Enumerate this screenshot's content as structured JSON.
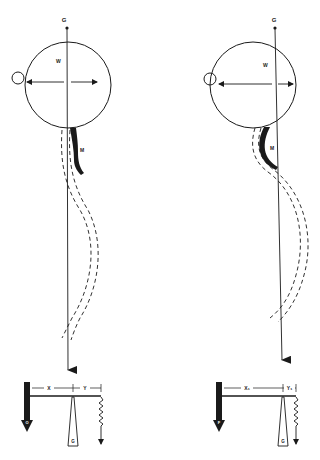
{
  "figure": {
    "ink_color": "#1a1a1a",
    "background": "#ffffff",
    "panels": [
      {
        "id": "left",
        "labels": {
          "gravity_top": "G",
          "sphere": "W",
          "member": "M",
          "distance_left": "X",
          "distance_right": "Y",
          "weight": "G",
          "force_block": "O"
        }
      },
      {
        "id": "right",
        "labels": {
          "gravity_top": "G",
          "sphere": "W",
          "member": "M",
          "distance_left": "X₁",
          "distance_right": "Y₁",
          "weight": "G",
          "force_block": "F"
        }
      }
    ]
  }
}
